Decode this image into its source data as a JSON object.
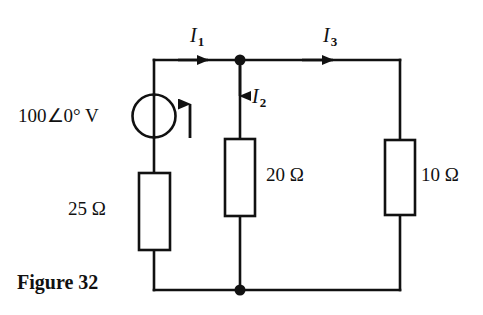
{
  "figure": {
    "caption": "Figure 32",
    "type": "circuit-schematic"
  },
  "source": {
    "label": "100∠0° V",
    "magnitude": 100,
    "phase_deg": 0,
    "unit": "V",
    "symbol": "ac-voltage-source-circle",
    "polarity_arrow": "up"
  },
  "resistors": [
    {
      "id": "r25",
      "label": "25 Ω",
      "value": 25,
      "unit": "Ω",
      "orientation": "vertical",
      "branch": "left"
    },
    {
      "id": "r20",
      "label": "20 Ω",
      "value": 20,
      "unit": "Ω",
      "orientation": "vertical",
      "branch": "middle"
    },
    {
      "id": "r10",
      "label": "10 Ω",
      "value": 10,
      "unit": "Ω",
      "orientation": "vertical",
      "branch": "right"
    }
  ],
  "currents": [
    {
      "id": "i1",
      "symbol": "I",
      "subscript": "1",
      "direction": "right",
      "branch": "left-top"
    },
    {
      "id": "i2",
      "symbol": "I",
      "subscript": "2",
      "direction": "down",
      "branch": "middle"
    },
    {
      "id": "i3",
      "symbol": "I",
      "subscript": "3",
      "direction": "right",
      "branch": "right-top"
    }
  ],
  "nodes": [
    {
      "id": "top-node",
      "x": 240,
      "y": 60
    },
    {
      "id": "bottom-node",
      "x": 240,
      "y": 290
    }
  ],
  "colors": {
    "background": "#ffffff",
    "ink": "#111111"
  }
}
